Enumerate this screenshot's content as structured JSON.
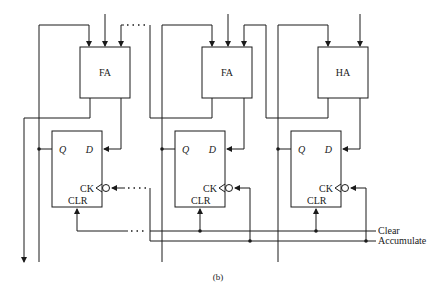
{
  "diagram": {
    "caption": "(b)",
    "stages": [
      {
        "adder": {
          "label": "FA"
        },
        "flipflop": {
          "q": "Q",
          "d": "D",
          "ck": "CK",
          "clr": "CLR"
        }
      },
      {
        "adder": {
          "label": "FA"
        },
        "flipflop": {
          "q": "Q",
          "d": "D",
          "ck": "CK",
          "clr": "CLR"
        }
      },
      {
        "adder": {
          "label": "HA"
        },
        "flipflop": {
          "q": "Q",
          "d": "D",
          "ck": "CK",
          "clr": "CLR"
        }
      }
    ],
    "signals": {
      "clear": "Clear",
      "accumulate": "Accumulate"
    }
  }
}
